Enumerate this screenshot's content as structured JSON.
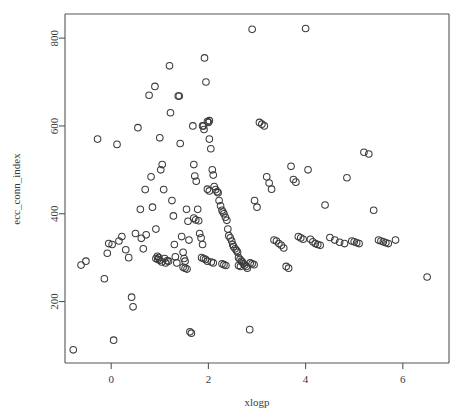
{
  "chart_data": {
    "type": "scatter",
    "title": "",
    "xlabel": "xlogp",
    "ylabel": "ecc_conn_index",
    "xlim": [
      -0.95,
      6.95
    ],
    "ylim": [
      60,
      855
    ],
    "grid": false,
    "legend": false,
    "xticks": [
      0,
      2,
      4,
      6
    ],
    "yticks": [
      200,
      400,
      600,
      800
    ],
    "xticklabels": [
      "0",
      "2",
      "4",
      "6"
    ],
    "yticklabels": [
      "200",
      "400",
      "600",
      "800"
    ],
    "marker": "open-circle",
    "marker_color": "#3c3c3c",
    "n_points": 178,
    "points": [
      [
        -0.78,
        90
      ],
      [
        -0.62,
        283
      ],
      [
        -0.52,
        292
      ],
      [
        -0.28,
        570
      ],
      [
        -0.14,
        252
      ],
      [
        -0.08,
        310
      ],
      [
        -0.05,
        332
      ],
      [
        0.02,
        330
      ],
      [
        0.05,
        112
      ],
      [
        0.12,
        558
      ],
      [
        0.16,
        338
      ],
      [
        0.22,
        348
      ],
      [
        0.3,
        318
      ],
      [
        0.36,
        300
      ],
      [
        0.42,
        210
      ],
      [
        0.45,
        188
      ],
      [
        0.5,
        355
      ],
      [
        0.55,
        596
      ],
      [
        0.6,
        410
      ],
      [
        0.62,
        344
      ],
      [
        0.66,
        320
      ],
      [
        0.7,
        455
      ],
      [
        0.72,
        352
      ],
      [
        0.78,
        670
      ],
      [
        0.82,
        484
      ],
      [
        0.85,
        415
      ],
      [
        0.9,
        690
      ],
      [
        0.92,
        365
      ],
      [
        0.95,
        303
      ],
      [
        0.98,
        300
      ],
      [
        1.0,
        573
      ],
      [
        1.02,
        500
      ],
      [
        1.05,
        512
      ],
      [
        1.08,
        455
      ],
      [
        1.1,
        298
      ],
      [
        1.12,
        288
      ],
      [
        1.15,
        293
      ],
      [
        1.18,
        292
      ],
      [
        1.2,
        737
      ],
      [
        1.22,
        630
      ],
      [
        1.25,
        430
      ],
      [
        1.28,
        395
      ],
      [
        1.3,
        330
      ],
      [
        1.32,
        302
      ],
      [
        1.35,
        288
      ],
      [
        1.38,
        668
      ],
      [
        1.4,
        668
      ],
      [
        1.42,
        560
      ],
      [
        1.45,
        348
      ],
      [
        1.48,
        312
      ],
      [
        1.5,
        298
      ],
      [
        1.52,
        292
      ],
      [
        1.55,
        410
      ],
      [
        1.58,
        383
      ],
      [
        1.6,
        340
      ],
      [
        1.62,
        131
      ],
      [
        1.65,
        128
      ],
      [
        1.68,
        600
      ],
      [
        1.7,
        512
      ],
      [
        1.72,
        486
      ],
      [
        1.75,
        474
      ],
      [
        1.78,
        410
      ],
      [
        1.8,
        384
      ],
      [
        1.82,
        355
      ],
      [
        1.85,
        345
      ],
      [
        1.88,
        330
      ],
      [
        1.9,
        600
      ],
      [
        1.92,
        755
      ],
      [
        1.95,
        700
      ],
      [
        1.98,
        610
      ],
      [
        2.0,
        608
      ],
      [
        2.02,
        570
      ],
      [
        2.05,
        548
      ],
      [
        2.08,
        500
      ],
      [
        2.1,
        488
      ],
      [
        2.12,
        462
      ],
      [
        2.15,
        455
      ],
      [
        2.18,
        450
      ],
      [
        2.2,
        448
      ],
      [
        2.22,
        430
      ],
      [
        2.25,
        418
      ],
      [
        2.28,
        408
      ],
      [
        2.3,
        404
      ],
      [
        2.32,
        400
      ],
      [
        2.35,
        392
      ],
      [
        2.38,
        385
      ],
      [
        2.4,
        365
      ],
      [
        2.42,
        350
      ],
      [
        2.45,
        345
      ],
      [
        2.48,
        338
      ],
      [
        2.5,
        330
      ],
      [
        2.52,
        325
      ],
      [
        2.55,
        320
      ],
      [
        2.58,
        316
      ],
      [
        2.6,
        312
      ],
      [
        2.62,
        300
      ],
      [
        2.65,
        296
      ],
      [
        2.68,
        292
      ],
      [
        2.7,
        290
      ],
      [
        2.72,
        286
      ],
      [
        2.75,
        283
      ],
      [
        2.78,
        280
      ],
      [
        2.8,
        276
      ],
      [
        2.85,
        136
      ],
      [
        2.9,
        820
      ],
      [
        2.95,
        430
      ],
      [
        3.0,
        415
      ],
      [
        3.05,
        608
      ],
      [
        3.1,
        604
      ],
      [
        3.15,
        600
      ],
      [
        3.2,
        484
      ],
      [
        3.25,
        470
      ],
      [
        3.3,
        456
      ],
      [
        3.35,
        340
      ],
      [
        3.4,
        338
      ],
      [
        3.45,
        332
      ],
      [
        3.5,
        328
      ],
      [
        3.55,
        322
      ],
      [
        3.6,
        280
      ],
      [
        3.65,
        276
      ],
      [
        3.7,
        508
      ],
      [
        3.75,
        478
      ],
      [
        3.8,
        472
      ],
      [
        3.85,
        348
      ],
      [
        3.9,
        345
      ],
      [
        3.95,
        342
      ],
      [
        4.0,
        822
      ],
      [
        4.05,
        500
      ],
      [
        4.1,
        342
      ],
      [
        4.15,
        336
      ],
      [
        4.2,
        332
      ],
      [
        4.25,
        330
      ],
      [
        4.3,
        328
      ],
      [
        4.4,
        420
      ],
      [
        4.5,
        346
      ],
      [
        4.6,
        340
      ],
      [
        4.7,
        335
      ],
      [
        4.8,
        332
      ],
      [
        4.85,
        482
      ],
      [
        4.95,
        338
      ],
      [
        5.0,
        336
      ],
      [
        5.05,
        334
      ],
      [
        5.1,
        332
      ],
      [
        5.2,
        540
      ],
      [
        5.3,
        536
      ],
      [
        5.4,
        408
      ],
      [
        5.5,
        340
      ],
      [
        5.55,
        338
      ],
      [
        5.6,
        336
      ],
      [
        5.65,
        334
      ],
      [
        5.7,
        332
      ],
      [
        5.85,
        340
      ],
      [
        6.5,
        256
      ],
      [
        1.88,
        600
      ],
      [
        1.91,
        592
      ],
      [
        2.02,
        612
      ],
      [
        1.48,
        278
      ],
      [
        1.52,
        276
      ],
      [
        1.56,
        274
      ],
      [
        2.62,
        282
      ],
      [
        2.66,
        280
      ],
      [
        1.7,
        390
      ],
      [
        1.74,
        386
      ],
      [
        2.86,
        288
      ],
      [
        2.9,
        286
      ],
      [
        2.94,
        284
      ],
      [
        0.92,
        298
      ],
      [
        0.96,
        296
      ],
      [
        1.0,
        294
      ],
      [
        1.04,
        290
      ],
      [
        2.28,
        286
      ],
      [
        2.32,
        284
      ],
      [
        2.36,
        282
      ],
      [
        1.98,
        456
      ],
      [
        2.02,
        452
      ],
      [
        1.86,
        300
      ],
      [
        1.9,
        298
      ],
      [
        1.94,
        296
      ],
      [
        1.98,
        292
      ],
      [
        2.06,
        290
      ],
      [
        2.1,
        288
      ]
    ]
  }
}
